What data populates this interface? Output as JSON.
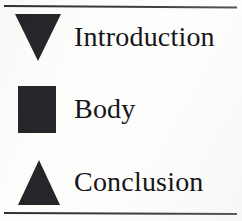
{
  "figure": {
    "background_color": "#fdfdfc",
    "shape_color": "#25252a",
    "text_color": "#15151a",
    "rule_color": "#3a3a3c",
    "items": [
      {
        "label": "Introduction",
        "marker": "triangle-down-icon"
      },
      {
        "label": "Body",
        "marker": "square-icon"
      },
      {
        "label": "Conclusion",
        "marker": "triangle-up-icon"
      }
    ]
  }
}
